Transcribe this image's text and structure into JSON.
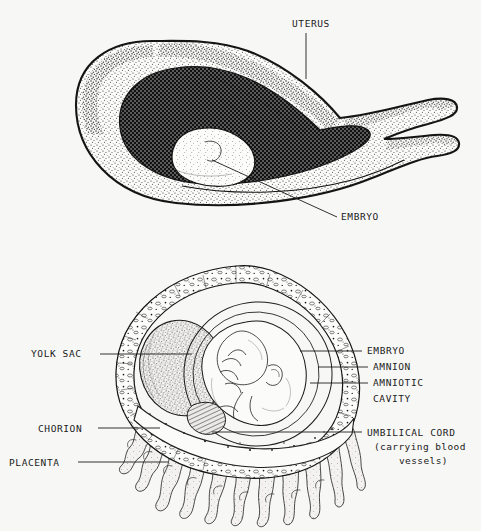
{
  "page": {
    "background_color": "#f7f7f6",
    "ink_color": "#141414",
    "width": 481,
    "height": 531
  },
  "figures": [
    {
      "id": "uterus-section",
      "name": "Uterus containing embryo (longitudinal section)",
      "labels": [
        {
          "key": "uterus",
          "text": "UTERUS",
          "text_x": 292,
          "text_y": 27,
          "leader": "M 306 33 L 306 79",
          "leader_type": "vertical"
        },
        {
          "key": "embryo",
          "text": "EMBRYO",
          "text_x": 341,
          "text_y": 220,
          "leader": "M 337 217 L 212 160",
          "leader_type": "diagonal"
        }
      ],
      "regions": [
        {
          "key": "uterine-wall",
          "fill_style": "stipple"
        },
        {
          "key": "uterine-cavity",
          "fill_style": "crosshatch-dark"
        },
        {
          "key": "embryo-bulge",
          "fill_style": "light-stipple"
        }
      ]
    },
    {
      "id": "fetal-membranes",
      "name": "Embryo with fetal membranes and placenta",
      "labels": [
        {
          "key": "yolk-sac",
          "text": "YOLK SAC",
          "text_x": 31,
          "text_y": 357,
          "align": "left",
          "leader": "M 100 354 L 192 354"
        },
        {
          "key": "chorion",
          "text": "CHORION",
          "text_x": 38,
          "text_y": 432,
          "align": "left",
          "leader": "M 98 428 L 160 428"
        },
        {
          "key": "placenta",
          "text": "PLACENTA",
          "text_x": 9,
          "text_y": 466,
          "align": "left",
          "leader": "M 78 462 L 168 462"
        },
        {
          "key": "embryo",
          "text": "EMBRYO",
          "text_x": 367,
          "text_y": 354,
          "align": "right",
          "leader": "M 300 351 L 362 351"
        },
        {
          "key": "amnion",
          "text": "AMNION",
          "text_x": 373,
          "text_y": 370,
          "align": "right",
          "leader": "M 318 367 L 368 367"
        },
        {
          "key": "amniotic-cavity",
          "text": "AMNIOTIC",
          "text_line2": "CAVITY",
          "text_x": 373,
          "text_y": 386,
          "text_y2": 402,
          "align": "right",
          "leader": "M 310 383 L 368 383"
        },
        {
          "key": "umbilical-cord",
          "text": "UMBILICAL CORD",
          "text_line2": "(carrying blood",
          "text_line3": "vessels)",
          "text_x": 367,
          "text_y": 436,
          "text_y2": 450,
          "text_y3": 464,
          "align": "right",
          "leader": "M 212 432 L 362 432"
        }
      ],
      "regions": [
        {
          "key": "chorion-wall",
          "fill_style": "cellular-band"
        },
        {
          "key": "yolk-sac-mass",
          "fill_style": "dense-stipple"
        },
        {
          "key": "amniotic-cavity-space",
          "fill_style": "blank"
        },
        {
          "key": "embryo-body",
          "fill_style": "line-shaded"
        },
        {
          "key": "umbilical-cord-band",
          "fill_style": "hatched"
        },
        {
          "key": "placental-villi",
          "fill_style": "branching-outline"
        }
      ]
    }
  ]
}
